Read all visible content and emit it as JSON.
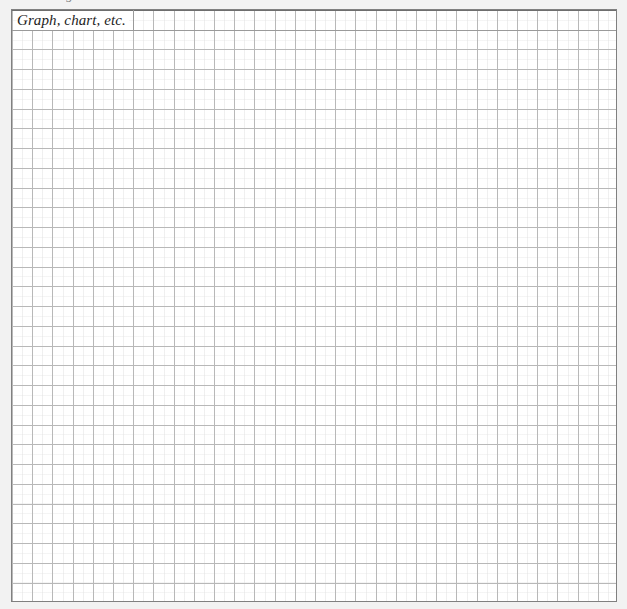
{
  "page": {
    "background_color": "#f2f2f2",
    "width": 627,
    "height": 609
  },
  "clipped_heading": {
    "text": "g",
    "note_visible_fragment": "descender of a letter clipped at the top edge"
  },
  "grid_block": {
    "caption": "Graph, chart, etc.",
    "background_color": "#ffffff",
    "border_color": "#808080",
    "gridline_color": "#b8b8b8",
    "columns": 30,
    "rows": 30,
    "cell_width_px": 20.2,
    "cell_height_px": 19.75
  },
  "chart_data": {
    "type": "table",
    "title": "Graph, chart, etc.",
    "subtitle": "",
    "xlabel": "",
    "ylabel": "",
    "categories": [],
    "values": [],
    "series": [],
    "grid": true,
    "legend_position": "none",
    "annotations": [
      "Graph, chart, etc."
    ],
    "columns": 30,
    "rows": 30
  }
}
